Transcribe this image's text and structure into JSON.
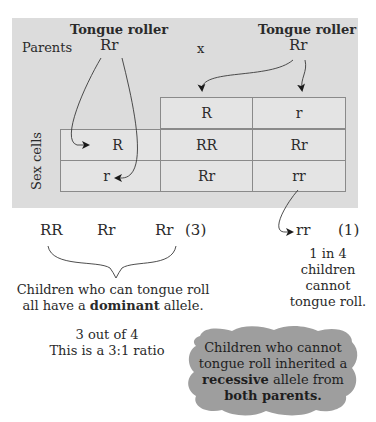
{
  "parents": {
    "label": "Parents",
    "cross_symbol": "x",
    "left": {
      "title": "Tongue roller",
      "genotype": "Rr"
    },
    "right": {
      "title": "Tongue roller",
      "genotype": "Rr"
    }
  },
  "punnett": {
    "side_label": "Sex cells",
    "column_headers": [
      "R",
      "r"
    ],
    "row_headers": [
      "R",
      "r"
    ],
    "cells": [
      [
        "RR",
        "Rr"
      ],
      [
        "Rr",
        "rr"
      ]
    ]
  },
  "outcomes": {
    "dominant_genotypes": [
      "RR",
      "Rr",
      "Rr"
    ],
    "dominant_count": "(3)",
    "dominant_caption_line1": "Children who can tongue roll",
    "dominant_caption_line2_pre": "all have a ",
    "dominant_caption_bold": "dominant",
    "dominant_caption_line2_post": " allele.",
    "ratio_line1": "3 out of 4",
    "ratio_line2": "This is a 3:1 ratio",
    "recessive_genotype": "rr",
    "recessive_count": "(1)",
    "recessive_caption": [
      "1 in 4",
      "children",
      "cannot",
      "tongue roll."
    ]
  },
  "callout": {
    "line1": "Children who cannot",
    "line2": "tongue roll inherited a",
    "line3_bold": "recessive",
    "line3_post": " allele from",
    "line4_bold": "both parents."
  },
  "colors": {
    "panel": "#dcdcdc",
    "cell": "#e4e4e4",
    "cloud": "#9e9e9e",
    "text": "#2a2a2a"
  }
}
